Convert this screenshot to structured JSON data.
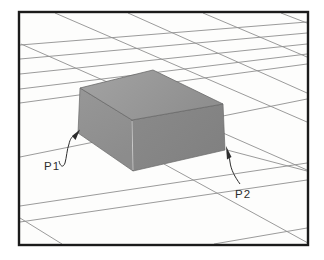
{
  "meta": {
    "width": 324,
    "height": 260
  },
  "colors": {
    "page_background": "#ffffff",
    "paper": "#fdfdfc",
    "frame_border": "#1b1b1b",
    "grid_line": "#8f8f8f",
    "box_top_light": "#a3a3a3",
    "box_top_dark": "#8f8f8f",
    "box_left_light": "#979797",
    "box_left_dark": "#8c8c8c",
    "box_right_light": "#8a8a8a",
    "box_right_dark": "#818181",
    "box_edge": "#6a6a6a",
    "front_edge_highlight": "#c9c9c9",
    "annotation": "#2d2d2d"
  },
  "frame": {
    "x": 19,
    "y": 12,
    "w": 289,
    "h": 233,
    "border_width": 2.4
  },
  "grid": {
    "line_width": 0.9,
    "segments": [
      [
        20,
        45,
        307,
        22
      ],
      [
        20,
        59,
        307,
        33
      ],
      [
        20,
        74,
        307,
        44
      ],
      [
        20,
        89,
        307,
        54
      ],
      [
        20,
        103,
        307,
        64
      ],
      [
        20,
        157,
        307,
        99
      ],
      [
        20,
        206,
        307,
        163
      ],
      [
        20,
        222,
        307,
        180
      ],
      [
        214,
        244,
        307,
        228
      ],
      [
        21,
        44,
        307,
        170
      ],
      [
        55,
        13,
        307,
        122
      ],
      [
        128,
        13,
        307,
        93
      ],
      [
        203,
        13,
        307,
        57
      ],
      [
        281,
        13,
        307,
        23
      ],
      [
        20,
        218,
        62,
        244
      ],
      [
        164,
        164,
        308,
        243
      ],
      [
        227,
        150,
        307,
        171
      ]
    ]
  },
  "box": {
    "top_face_points": "153,70 223,104 132,120 80,88",
    "left_face_points": "80,88 132,120 133,171 78,133",
    "right_face_points": "132,120 223,104 225,150 133,171",
    "front_edge_line": [
      132,
      121,
      133,
      170
    ]
  },
  "annotations": [
    {
      "id": "P1",
      "text": "P1",
      "text_x": 44,
      "text_y": 170,
      "leader_path": "M59,161 C60,166 63,168.5 65,163 C66.5,158 67,149 69,144 C70,139 72,137 74,135",
      "arrow_points": "80,129.5 72,136 75.5,140"
    },
    {
      "id": "P2",
      "text": "P2",
      "text_x": 235,
      "text_y": 198,
      "leader_path": "M240,184 C235,177 231,170 230,162 C229.3,157 228.7,154 228.3,152",
      "arrow_points": "226,146 231.5,157 227,159.5"
    }
  ],
  "label_style": {
    "font_size": 11.5
  }
}
